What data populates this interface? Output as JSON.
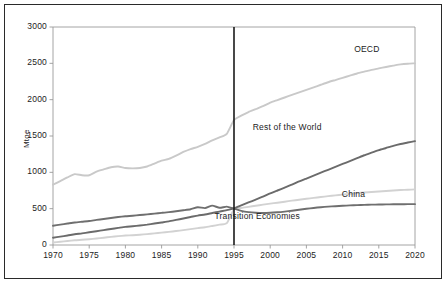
{
  "chart_data": {
    "type": "line",
    "title": "",
    "subtitle": "",
    "xlabel": "",
    "ylabel": "Mtoe",
    "xlim": [
      1970,
      2020
    ],
    "ylim": [
      0,
      3000
    ],
    "yticks": [
      0,
      500,
      1000,
      1500,
      2000,
      2500,
      3000
    ],
    "xticks": [
      1970,
      1975,
      1980,
      1985,
      1990,
      1995,
      2000,
      2005,
      2010,
      2015,
      2020
    ],
    "grid": false,
    "legend_position": "inline-right-of-curves",
    "annotations": [
      {
        "text": "vertical divider at 1995 separating history from projection",
        "x": 1995
      }
    ],
    "x": [
      1970,
      1971,
      1972,
      1973,
      1974,
      1975,
      1976,
      1977,
      1978,
      1979,
      1980,
      1981,
      1982,
      1983,
      1984,
      1985,
      1986,
      1987,
      1988,
      1989,
      1990,
      1991,
      1992,
      1993,
      1994,
      1995,
      1996,
      1997,
      1998,
      1999,
      2000,
      2001,
      2002,
      2003,
      2004,
      2005,
      2006,
      2007,
      2008,
      2009,
      2010,
      2011,
      2012,
      2013,
      2014,
      2015,
      2016,
      2017,
      2018,
      2019,
      2020
    ],
    "series": [
      {
        "name": "OECD",
        "color": "#c9c9c9",
        "label_x": 2014,
        "label_y": 2700,
        "values": [
          830,
          880,
          930,
          975,
          960,
          960,
          1010,
          1040,
          1070,
          1080,
          1060,
          1055,
          1060,
          1080,
          1120,
          1160,
          1185,
          1230,
          1280,
          1320,
          1350,
          1390,
          1440,
          1480,
          1530,
          1720,
          1780,
          1830,
          1870,
          1910,
          1960,
          1995,
          2030,
          2065,
          2100,
          2135,
          2170,
          2205,
          2240,
          2270,
          2300,
          2330,
          2360,
          2385,
          2410,
          2430,
          2450,
          2468,
          2485,
          2495,
          2500
        ]
      },
      {
        "name": "Rest of the World",
        "color": "#6b6b6b",
        "label_x": 2006,
        "label_y": 1620,
        "values": [
          100,
          115,
          130,
          148,
          160,
          175,
          190,
          205,
          220,
          235,
          250,
          258,
          268,
          280,
          295,
          310,
          325,
          345,
          365,
          385,
          405,
          420,
          440,
          460,
          480,
          505,
          545,
          585,
          625,
          665,
          710,
          750,
          790,
          830,
          875,
          915,
          955,
          995,
          1035,
          1075,
          1115,
          1155,
          1195,
          1235,
          1270,
          1305,
          1335,
          1365,
          1390,
          1410,
          1430
        ]
      },
      {
        "name": "China",
        "color": "#d2d2d2",
        "label_x": 2012,
        "label_y": 700,
        "values": [
          35,
          45,
          55,
          65,
          72,
          80,
          90,
          100,
          112,
          122,
          130,
          135,
          142,
          150,
          160,
          170,
          180,
          192,
          205,
          218,
          232,
          245,
          262,
          280,
          300,
          490,
          510,
          525,
          540,
          555,
          570,
          582,
          596,
          610,
          623,
          636,
          648,
          660,
          672,
          683,
          694,
          704,
          714,
          722,
          730,
          737,
          744,
          750,
          756,
          760,
          765
        ]
      },
      {
        "name": "Transition Economies",
        "color": "#6f6f6f",
        "label_x": 2003,
        "label_y": 400,
        "values": [
          265,
          280,
          295,
          310,
          320,
          330,
          345,
          358,
          372,
          385,
          395,
          402,
          412,
          422,
          432,
          442,
          452,
          465,
          478,
          492,
          520,
          508,
          542,
          512,
          528,
          500,
          470,
          452,
          443,
          440,
          443,
          450,
          460,
          472,
          485,
          498,
          510,
          520,
          528,
          534,
          540,
          545,
          549,
          552,
          555,
          557,
          559,
          560,
          561,
          562,
          562
        ]
      }
    ]
  },
  "axis": {
    "ylabel": "Mtoe",
    "ytick_labels": [
      "3000",
      "2500",
      "2000",
      "1500",
      "1000",
      "500",
      "0"
    ],
    "xtick_labels": [
      "1970",
      "1975",
      "1980",
      "1985",
      "1990",
      "1995",
      "2000",
      "2005",
      "2010",
      "2015",
      "2020"
    ]
  },
  "series_labels": [
    {
      "name": "OECD",
      "text": "OECD"
    },
    {
      "name": "Rest of the World",
      "text": "Rest of the World"
    },
    {
      "name": "China",
      "text": "China"
    },
    {
      "name": "Transition Economies",
      "text": "Transition Economies"
    }
  ],
  "colors": {
    "oecd": "#c9c9c9",
    "rest_of_world": "#6b6b6b",
    "china": "#d2d2d2",
    "transition_economies": "#6f6f6f",
    "axis": "#9a9a9a",
    "divider": "#1a1a1a",
    "frame": "#2a2a2a",
    "text": "#1c1c1c"
  }
}
